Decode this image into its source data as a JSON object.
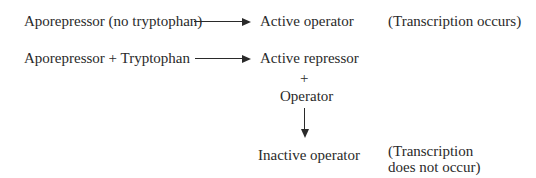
{
  "row1": {
    "left": "Aporepressor (no tryptophan)",
    "right": "Active operator",
    "note": "(Transcription occurs)"
  },
  "row2": {
    "left": "Aporepressor + Tryptophan",
    "right": "Active repressor",
    "plus": "+",
    "operator": "Operator",
    "result": "Inactive operator",
    "note_line1": "(Transcription",
    "note_line2": "does not occur)"
  },
  "icons": [
    "right-arrow-icon",
    "right-arrow-icon",
    "down-arrow-icon"
  ]
}
